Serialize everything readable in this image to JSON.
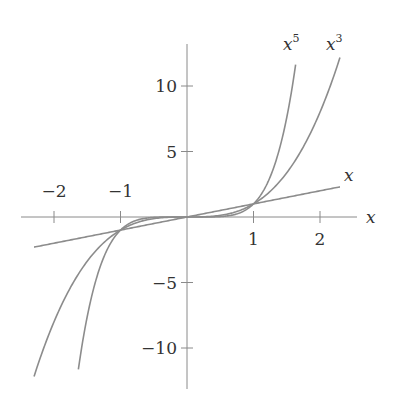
{
  "chart_data": {
    "type": "line",
    "title": "",
    "xlabel": "x",
    "ylabel": "",
    "xlim": [
      -2.5,
      2.5
    ],
    "ylim": [
      -13,
      13
    ],
    "grid": false,
    "x_ticks": [
      -2,
      -1,
      1,
      2
    ],
    "x_tick_labels": [
      "−2",
      "−1",
      "1",
      "2"
    ],
    "y_ticks": [
      10,
      5,
      -5,
      -10
    ],
    "y_tick_labels": [
      "10",
      "5",
      "−5",
      "−10"
    ],
    "series": [
      {
        "name": "x",
        "label": "x",
        "function": "x",
        "domain": [
          -2.3,
          2.3
        ]
      },
      {
        "name": "x^3",
        "label": "x3",
        "function": "x^3",
        "domain": [
          -2.3,
          2.3
        ]
      },
      {
        "name": "x^5",
        "label": "x5",
        "function": "x^5",
        "domain": [
          -1.65,
          1.65
        ]
      }
    ],
    "color": "#8c8c8c"
  },
  "labels": {
    "x_axis": "x",
    "line_x": "x",
    "x3_base": "x",
    "x3_exp": "3",
    "x5_base": "x",
    "x5_exp": "5"
  }
}
